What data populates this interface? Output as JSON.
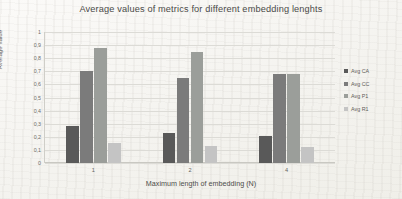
{
  "chart_data": {
    "type": "bar",
    "title": "Average values of metrics for different embedding lenghts",
    "xlabel": "Maximum length of embedding (N)",
    "ylabel": "Average value",
    "categories": [
      "1",
      "2",
      "4"
    ],
    "ylim": [
      0,
      1
    ],
    "yticks": [
      "0",
      "0,1",
      "0,2",
      "0,3",
      "0,4",
      "0,5",
      "0,6",
      "0,7",
      "0,8",
      "0,9",
      "1"
    ],
    "grid": true,
    "legend_position": "right",
    "series": [
      {
        "name": "Avg CA",
        "color": "#595959",
        "values": [
          0.28,
          0.23,
          0.21
        ]
      },
      {
        "name": "Avg CC",
        "color": "#7b7b7b",
        "values": [
          0.7,
          0.65,
          0.68
        ]
      },
      {
        "name": "Avg P1",
        "color": "#9b9e9a",
        "values": [
          0.88,
          0.85,
          0.68
        ]
      },
      {
        "name": "Avg R1",
        "color": "#c4c4c4",
        "values": [
          0.15,
          0.13,
          0.12
        ]
      }
    ]
  }
}
